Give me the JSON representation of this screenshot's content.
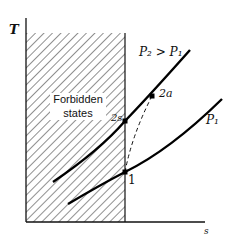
{
  "diagram": {
    "type": "T-s diagram",
    "axes": {
      "y_label": "T",
      "x_label": "s"
    },
    "region": {
      "label_line1": "Forbidden",
      "label_line2": "states"
    },
    "curves": [
      {
        "name": "high-pressure isobar",
        "label": "P₂ > P₁"
      },
      {
        "name": "low-pressure isobar",
        "label": "P₁"
      },
      {
        "name": "actual process",
        "style": "dashed"
      }
    ],
    "points": [
      {
        "id": "1",
        "label": "1"
      },
      {
        "id": "2s",
        "label": "2s"
      },
      {
        "id": "2a",
        "label": "2a"
      }
    ]
  }
}
